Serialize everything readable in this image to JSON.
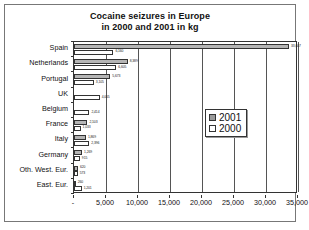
{
  "chart_data": {
    "type": "bar",
    "orientation": "horizontal",
    "title": "Cocaine seizures in Europe in 2000 and 2001 in kg",
    "title_line1": "Cocaine seizures in Europe",
    "title_line2": "in 2000 and 2001 in kg",
    "xlabel": "",
    "ylabel": "",
    "xlim": [
      0,
      35000
    ],
    "grid": true,
    "legend_position": "middle-right",
    "categories": [
      "Spain",
      "Netherlands",
      "Portugal",
      "UK",
      "Belgium",
      "France",
      "Italy",
      "Germany",
      "Oth. West. Eur.",
      "East. Eur."
    ],
    "xticks": [
      "-",
      "5,000",
      "10,000",
      "15,000",
      "20,000",
      "25,000",
      "30,000",
      "35,000"
    ],
    "xtick_values": [
      0,
      5000,
      10000,
      15000,
      20000,
      25000,
      30000,
      35000
    ],
    "series": [
      {
        "name": "2001",
        "color": "#b5b5b5",
        "values": [
          33607,
          8389,
          5673,
          0,
          0,
          2103,
          1869,
          1269,
          620,
          260
        ],
        "labels": [
          "33,607",
          "8,389",
          "5,673",
          "",
          "",
          "2,103",
          "1,869",
          "1,269",
          "620",
          "260"
        ]
      },
      {
        "name": "2000",
        "color": "#ffffff",
        "values": [
          6160,
          6605,
          3105,
          4005,
          2414,
          1033,
          2396,
          915,
          573,
          1201
        ],
        "labels": [
          "6,160",
          "6,605",
          "3,105",
          "4,005",
          "2,414",
          "1,033",
          "2,396",
          "915",
          "573",
          "1,201"
        ]
      }
    ]
  },
  "legend": {
    "items": [
      {
        "label": "2001",
        "swatch": "gray"
      },
      {
        "label": "2000",
        "swatch": "white"
      }
    ]
  }
}
